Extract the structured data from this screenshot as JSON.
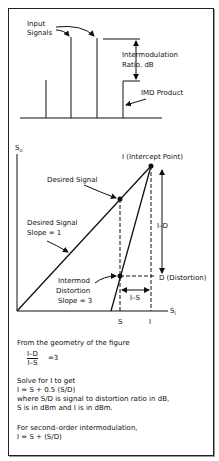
{
  "spectrum": {
    "input_signals_label_1": "Input",
    "input_signals_label_2": "Signals",
    "ratio_label_1": "Intermodulation",
    "ratio_label_2": "Ratio, dB",
    "imd_label": "IMD Product"
  },
  "graph": {
    "y_axis_label": "S",
    "y_axis_sub": "o",
    "x_axis_label": "S",
    "x_axis_sub": "i",
    "intercept_label": "I (Intercept Point)",
    "desired_signal_label": "Desired Signal",
    "desired_slope_label_1": "Desired Signal",
    "desired_slope_label_2": "Slope = 1",
    "intermod_label_1": "Intermod",
    "intermod_label_2": "Distortion",
    "intermod_label_3": "Slope = 3",
    "i_minus_d": "I–D",
    "i_minus_s": "I–S",
    "distortion_label": "D (Distortion)",
    "s_tick": "S",
    "i_tick": "I"
  },
  "text": {
    "line1": "From the geometry of the figure",
    "frac_num": "I–D",
    "frac_den": "I–S",
    "frac_eq": "=3",
    "line2": "Solve for I to get",
    "line3": "I = S + 0.5 (S/D)",
    "line4": "where S/D is signal to distortion ratio in dB,",
    "line5": "S is in dBm and I is in dBm.",
    "line6": "For second–order intermodulation,",
    "line7": "I = S + (S/D)"
  }
}
